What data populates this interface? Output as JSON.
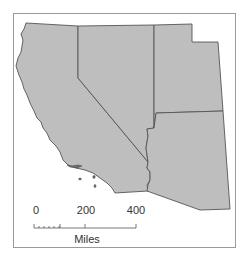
{
  "map": {
    "regions": [
      {
        "name": "California"
      },
      {
        "name": "Nevada"
      },
      {
        "name": "Utah"
      },
      {
        "name": "Arizona"
      }
    ],
    "fill_color": "#bebebe",
    "border_color": "#555555",
    "frame_color": "#9a9a9a"
  },
  "scale_bar": {
    "ticks": [
      "0",
      "200",
      "400"
    ],
    "unit": "Miles"
  }
}
